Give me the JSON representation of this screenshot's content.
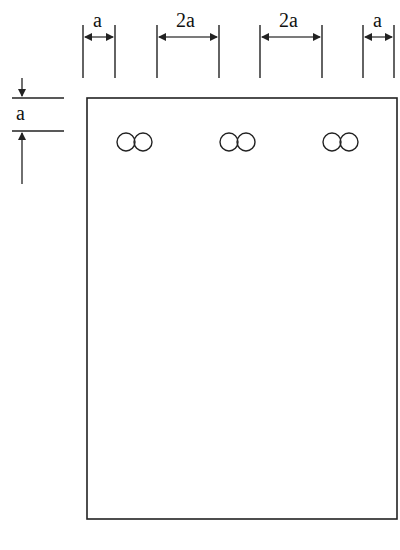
{
  "diagram": {
    "top_dimensions": [
      {
        "label": "a"
      },
      {
        "label": "2a"
      },
      {
        "label": "2a"
      },
      {
        "label": "a"
      }
    ],
    "side_dimension": {
      "label": "a"
    },
    "holes": [
      {
        "symbol": "double-circle"
      },
      {
        "symbol": "double-circle"
      },
      {
        "symbol": "double-circle"
      }
    ],
    "line_color": "#222222"
  }
}
